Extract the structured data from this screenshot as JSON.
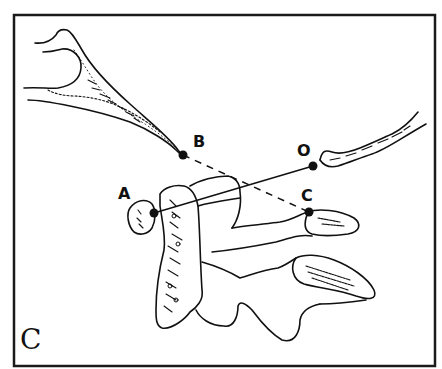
{
  "figure": {
    "panel_label": "C",
    "points": [
      {
        "id": "A",
        "label": "A",
        "x": 154,
        "y": 213,
        "label_x": 118,
        "label_y": 186
      },
      {
        "id": "B",
        "label": "B",
        "x": 183,
        "y": 155,
        "label_x": 193,
        "label_y": 134
      },
      {
        "id": "O",
        "label": "O",
        "x": 313,
        "y": 166,
        "label_x": 297,
        "label_y": 143
      },
      {
        "id": "C",
        "label": "C",
        "x": 309,
        "y": 212,
        "label_x": 301,
        "label_y": 188
      }
    ],
    "lines": [
      {
        "from": "A",
        "to": "O",
        "style": "solid"
      },
      {
        "from": "B",
        "to": "C",
        "style": "dashed"
      }
    ],
    "colors": {
      "ink": "#111111",
      "background": "#ffffff",
      "frame": "#1a1a1a"
    }
  }
}
